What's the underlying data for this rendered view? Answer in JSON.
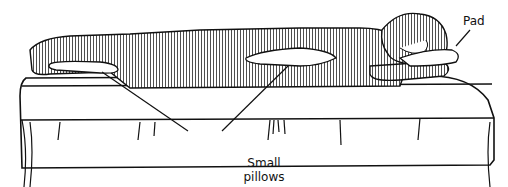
{
  "figure": {
    "labels": {
      "pad": "Pad",
      "pillows_line1": "Small",
      "pillows_line2": "pillows"
    },
    "colors": {
      "ink": "#111111",
      "background": "#ffffff"
    }
  }
}
